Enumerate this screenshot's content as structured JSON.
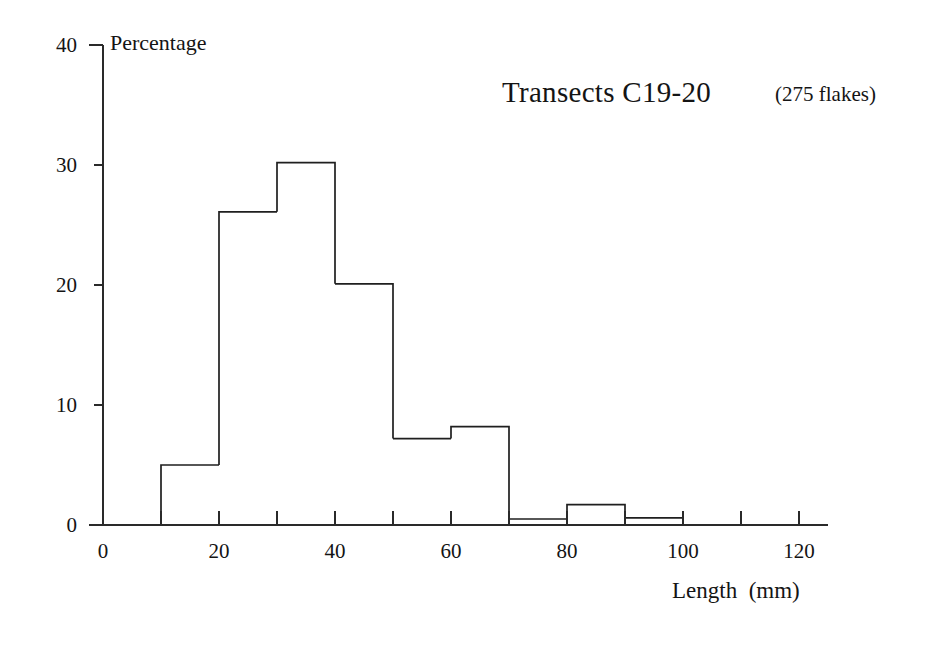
{
  "chart_data": {
    "type": "bar",
    "title": "Transects C19-20",
    "subtitle": "(275 flakes)",
    "xlabel": "Length  (mm)",
    "ylabel": "Percentage",
    "grid": false,
    "legend": "none",
    "bin_width": 10,
    "xlim": [
      0,
      125
    ],
    "ylim": [
      0,
      40
    ],
    "x_ticks": [
      0,
      20,
      40,
      60,
      80,
      100,
      120
    ],
    "x_minor_ticks": [
      10,
      30,
      50,
      70,
      90,
      110
    ],
    "y_ticks": [
      0,
      10,
      20,
      30,
      40
    ],
    "x_tick_labels": [
      "0",
      "20",
      "40",
      "60",
      "80",
      "100",
      "120"
    ],
    "y_tick_labels": [
      "0",
      "10",
      "20",
      "30",
      "40"
    ],
    "categories": [
      "0-10",
      "10-20",
      "20-30",
      "30-40",
      "40-50",
      "50-60",
      "60-70",
      "70-80",
      "80-90",
      "90-100",
      "100-110",
      "110-120"
    ],
    "bin_starts": [
      0,
      10,
      20,
      30,
      40,
      50,
      60,
      70,
      80,
      90,
      100,
      110
    ],
    "values": [
      0,
      5.0,
      26.1,
      30.2,
      20.1,
      7.2,
      8.2,
      0.5,
      1.7,
      0.6,
      0,
      0
    ]
  },
  "axis_titles": {
    "y": "Percentage",
    "x": "Length  (mm)"
  },
  "annotations": {
    "title": "Transects C19-20",
    "flake_count": "(275 flakes)"
  },
  "colors": {
    "bar_stroke": "#1f1f1f",
    "axis": "#2a2a2a",
    "text": "#141414",
    "background": "#ffffff"
  }
}
